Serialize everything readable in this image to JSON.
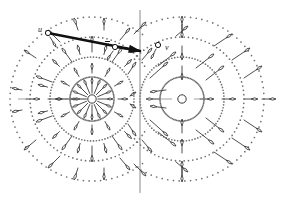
{
  "figure": {
    "kind": "vector-field-diagram",
    "background": "#ffffff",
    "ink": "#3a3a3a",
    "ink_strong": "#111111",
    "dot_color": "#6e6e6e",
    "axis_color": "#8a8a8a",
    "width": 293,
    "height": 201
  },
  "labels": {
    "u": "u",
    "v_bar": "v",
    "v": "v"
  },
  "nodes": {
    "u_point": {
      "x": 48,
      "y": 33,
      "r": 2.6
    },
    "v_bar_point": {
      "x": 115,
      "y": 47,
      "r": 2.6
    },
    "v_point": {
      "x": 158,
      "y": 45,
      "r": 2.6
    },
    "apex_point": {
      "x": 140,
      "y": 51
    },
    "left_center": {
      "x": 92,
      "y": 99,
      "r": 4.2
    },
    "right_center": {
      "x": 182,
      "y": 99,
      "r": 4.2
    }
  },
  "axes": {
    "vertical_x": 140,
    "vertical_y0": 10,
    "vertical_y1": 193,
    "horizontal_y": 99,
    "horizontal_x0": 18,
    "horizontal_x1": 282
  },
  "rings": {
    "left": [
      22,
      42,
      62,
      82
    ],
    "right": [
      22,
      42,
      62,
      82
    ],
    "dot_radius": 0.85,
    "dash_step_deg": 4
  },
  "vectors": [
    {
      "name": "u-to-apex",
      "from": "u_point",
      "to": "apex_point",
      "width": 2.6
    },
    {
      "name": "vbar-to-apex",
      "from": "v_bar_point",
      "to": "apex_point",
      "width": 2.2
    }
  ],
  "chart_data": {
    "type": "scatter",
    "title": "",
    "xlabel": "",
    "ylabel": "",
    "singularities": [
      {
        "label": "left-source",
        "x": 92,
        "y": 99,
        "type": "source"
      },
      {
        "label": "right-node",
        "x": 182,
        "y": 99,
        "type": "saddle-node"
      }
    ],
    "marked_points": [
      {
        "label": "u",
        "x": 48,
        "y": 33
      },
      {
        "label": "v",
        "x": 115,
        "y": 47,
        "overbar": true
      },
      {
        "label": "v",
        "x": 158,
        "y": 45,
        "overbar": false
      }
    ],
    "rings_left_radii": [
      22,
      42,
      62,
      82
    ],
    "rings_right_radii": [
      22,
      42,
      62,
      82
    ],
    "axis_vertical_x": 140,
    "axis_horizontal_y": 99,
    "grid": false,
    "legend": "none"
  }
}
